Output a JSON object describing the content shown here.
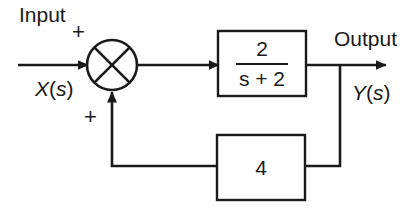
{
  "diagram": {
    "type": "control-system-block-diagram",
    "colors": {
      "background": "#ffffff",
      "stroke": "#1a1a1a",
      "text": "#1a1a1a"
    },
    "labels": {
      "input": "Input",
      "output": "Output",
      "input_signal_var": "X",
      "input_signal_arg": "(",
      "input_signal_s": "s",
      "input_signal_close": ")",
      "output_signal_var": "Y",
      "sum_sign_top": "+",
      "sum_sign_bottom": "+"
    },
    "summing_junction": {
      "name": "summing-junction",
      "shape": "circle-with-cross",
      "cx": 112,
      "cy": 65,
      "r": 25,
      "input_signs": [
        "+",
        "+"
      ]
    },
    "blocks": [
      {
        "name": "transfer-function-block",
        "kind": "fraction",
        "numerator": "2",
        "denominator": "s + 2",
        "expression": "2/(s + 2)",
        "x": 218,
        "y": 31,
        "width": 88,
        "height": 65
      },
      {
        "name": "feedback-gain-block",
        "kind": "scalar",
        "value": "4",
        "x": 217,
        "y": 135,
        "width": 88,
        "height": 65
      }
    ],
    "signals": [
      {
        "name": "input-signal-arrow",
        "from": "input",
        "to": "summing-junction",
        "label": "X(s)"
      },
      {
        "name": "error-signal-arrow",
        "from": "summing-junction",
        "to": "transfer-function-block"
      },
      {
        "name": "output-signal-arrow",
        "from": "transfer-function-block",
        "to": "output",
        "label": "Y(s)"
      },
      {
        "name": "feedback-branch-line",
        "from": "output-node",
        "to": "feedback-gain-block"
      },
      {
        "name": "feedback-return-arrow",
        "from": "feedback-gain-block",
        "to": "summing-junction"
      }
    ]
  }
}
